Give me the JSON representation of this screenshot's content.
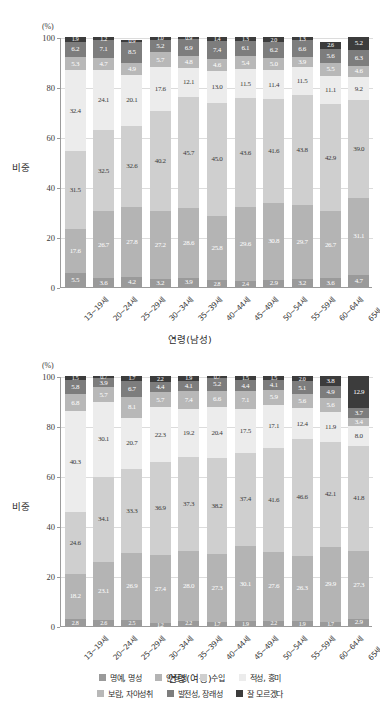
{
  "axis": {
    "unit": "(%)",
    "ylabel": "비중",
    "yticks": [
      "0",
      "20",
      "40",
      "60",
      "80",
      "100"
    ],
    "ylim": [
      0,
      100
    ]
  },
  "charts": {
    "male": {
      "xlabel": "연령(남성)"
    },
    "female": {
      "xlabel": "연령(여성)"
    }
  },
  "legend": {
    "row1": [
      {
        "label": "명예, 명성",
        "color": "#9a9a9a"
      },
      {
        "label": "안정성",
        "color": "#b4b4b4"
      },
      {
        "label": "수입",
        "color": "#cfcfcf"
      },
      {
        "label": "적성, 흥미",
        "color": "#ececec"
      }
    ],
    "row2": [
      {
        "label": "보람, 자아성취",
        "color": "#b8b8b8"
      },
      {
        "label": "발전성, 장래성",
        "color": "#7d7d7d"
      },
      {
        "label": "잘 모르겠다",
        "color": "#3c3c3c"
      }
    ]
  },
  "chart_data": [
    {
      "type": "bar",
      "stacked": true,
      "title": "연령(남성)",
      "xlabel": "연령(남성)",
      "ylabel": "비중",
      "unit": "(%)",
      "ylim": [
        0,
        100
      ],
      "grid": true,
      "legend_position": "bottom",
      "categories": [
        "13~19세",
        "20~24세",
        "25~29세",
        "30~34세",
        "35~39세",
        "40~44세",
        "45~49세",
        "50~54세",
        "55~59세",
        "60~64세",
        "65세 이상"
      ],
      "series": [
        {
          "name": "명예, 명성",
          "color": "#9a9a9a",
          "values": [
            5.5,
            3.6,
            4.2,
            3.2,
            3.9,
            2.8,
            2.4,
            2.9,
            3.2,
            3.6,
            4.7
          ]
        },
        {
          "name": "안정성",
          "color": "#b4b4b4",
          "values": [
            17.6,
            26.7,
            27.8,
            27.2,
            28.6,
            25.8,
            29.6,
            30.8,
            29.7,
            26.7,
            31.1
          ]
        },
        {
          "name": "수입",
          "color": "#cfcfcf",
          "values": [
            31.5,
            32.5,
            32.6,
            40.2,
            45.7,
            45.0,
            43.6,
            41.6,
            43.8,
            42.9,
            39.0
          ]
        },
        {
          "name": "적성, 흥미",
          "color": "#ececec",
          "values": [
            32.4,
            24.1,
            20.1,
            17.6,
            12.1,
            13.0,
            11.5,
            11.4,
            11.5,
            11.1,
            9.2
          ]
        },
        {
          "name": "보람, 자아성취",
          "color": "#b8b8b8",
          "values": [
            5.3,
            4.7,
            4.9,
            5.7,
            4.8,
            4.6,
            5.4,
            5.0,
            3.9,
            5.5,
            4.6
          ]
        },
        {
          "name": "발전성, 장래성",
          "color": "#7d7d7d",
          "values": [
            6.2,
            7.1,
            8.5,
            5.2,
            6.9,
            7.4,
            6.1,
            6.2,
            6.6,
            5.6,
            6.3
          ]
        },
        {
          "name": "잘 모르겠다",
          "color": "#3c3c3c",
          "values": [
            1.9,
            1.2,
            0.9,
            1.0,
            0.9,
            1.4,
            1.3,
            2.0,
            1.3,
            2.6,
            5.2
          ]
        }
      ]
    },
    {
      "type": "bar",
      "stacked": true,
      "title": "연령(여성)",
      "xlabel": "연령(여성)",
      "ylabel": "비중",
      "unit": "(%)",
      "ylim": [
        0,
        100
      ],
      "grid": true,
      "legend_position": "bottom",
      "categories": [
        "13~19세",
        "20~24세",
        "25~29세",
        "30~34세",
        "35~39세",
        "40~44세",
        "45~49세",
        "50~54세",
        "55~59세",
        "60~64세",
        "65세 이상"
      ],
      "series": [
        {
          "name": "명예, 명성",
          "color": "#9a9a9a",
          "values": [
            2.8,
            2.6,
            2.5,
            1.2,
            2.2,
            1.7,
            1.9,
            2.2,
            1.9,
            1.7,
            2.9
          ]
        },
        {
          "name": "안정성",
          "color": "#b4b4b4",
          "values": [
            18.2,
            23.1,
            26.9,
            27.4,
            28.0,
            27.3,
            30.1,
            27.6,
            26.3,
            29.9,
            27.3
          ]
        },
        {
          "name": "수입",
          "color": "#cfcfcf",
          "values": [
            24.6,
            34.1,
            33.3,
            36.9,
            37.3,
            38.2,
            37.4,
            41.6,
            46.6,
            42.1,
            41.8
          ]
        },
        {
          "name": "적성, 흥미",
          "color": "#ececec",
          "values": [
            40.3,
            30.1,
            20.7,
            22.3,
            19.2,
            20.4,
            17.5,
            17.1,
            12.4,
            11.9,
            8.0
          ]
        },
        {
          "name": "보람, 자아성취",
          "color": "#b8b8b8",
          "values": [
            6.8,
            5.7,
            8.1,
            5.7,
            7.4,
            6.6,
            7.1,
            5.9,
            5.6,
            5.6,
            3.4
          ]
        },
        {
          "name": "발전성, 장래성",
          "color": "#7d7d7d",
          "values": [
            5.8,
            3.9,
            6.7,
            4.4,
            4.1,
            5.2,
            4.4,
            4.1,
            5.1,
            4.9,
            3.7
          ]
        },
        {
          "name": "잘 모르겠다",
          "color": "#3c3c3c",
          "values": [
            1.5,
            0.7,
            1.7,
            2.2,
            1.9,
            0.7,
            1.5,
            1.5,
            2.0,
            3.8,
            12.9
          ]
        }
      ]
    }
  ]
}
